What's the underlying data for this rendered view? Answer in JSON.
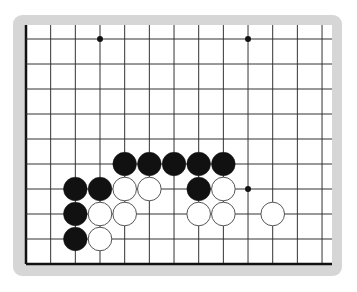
{
  "board": {
    "cols": 13,
    "rows": 10,
    "origin_x": 26,
    "origin_y": 39,
    "step_x": 24.67,
    "step_y": 25,
    "left_edge": true,
    "bottom_edge": true,
    "frame_color": "#d6d6d6",
    "board_color": "#ffffff",
    "line_color": "#333333",
    "edge_color": "#111111"
  },
  "star_points": [
    {
      "col": 3,
      "row": 0
    },
    {
      "col": 9,
      "row": 0
    },
    {
      "col": 9,
      "row": 6
    }
  ],
  "stones": [
    {
      "color": "black",
      "col": 4,
      "row": 5
    },
    {
      "color": "black",
      "col": 5,
      "row": 5
    },
    {
      "color": "black",
      "col": 6,
      "row": 5
    },
    {
      "color": "black",
      "col": 7,
      "row": 5
    },
    {
      "color": "black",
      "col": 8,
      "row": 5
    },
    {
      "color": "black",
      "col": 2,
      "row": 6
    },
    {
      "color": "black",
      "col": 3,
      "row": 6
    },
    {
      "color": "white",
      "col": 4,
      "row": 6
    },
    {
      "color": "white",
      "col": 5,
      "row": 6
    },
    {
      "color": "black",
      "col": 7,
      "row": 6
    },
    {
      "color": "white",
      "col": 8,
      "row": 6
    },
    {
      "color": "black",
      "col": 2,
      "row": 7
    },
    {
      "color": "white",
      "col": 3,
      "row": 7
    },
    {
      "color": "white",
      "col": 4,
      "row": 7
    },
    {
      "color": "white",
      "col": 7,
      "row": 7
    },
    {
      "color": "white",
      "col": 8,
      "row": 7
    },
    {
      "color": "white",
      "col": 10,
      "row": 7
    },
    {
      "color": "black",
      "col": 2,
      "row": 8
    },
    {
      "color": "white",
      "col": 3,
      "row": 8
    }
  ]
}
